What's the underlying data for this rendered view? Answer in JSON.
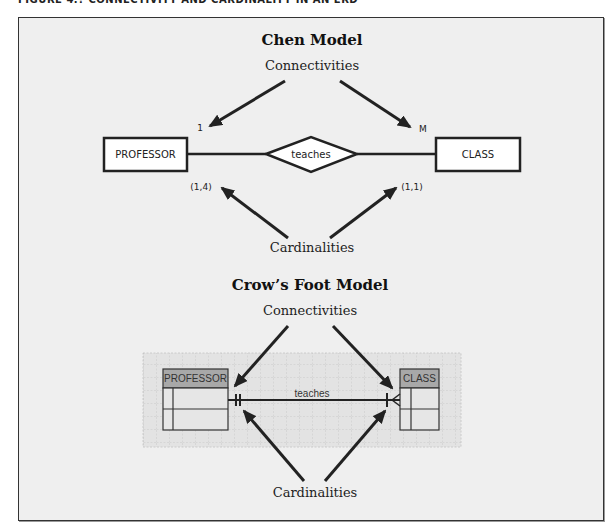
{
  "figure": {
    "caption": "FIGURE 4.? CONNECTIVITY AND CARDINALITY IN AN ERD"
  },
  "chen": {
    "title": "Chen Model",
    "connectivities_label": "Connectivities",
    "cardinalities_label": "Cardinalities",
    "entity_left": "PROFESSOR",
    "entity_right": "CLASS",
    "relationship": "teaches",
    "connectivity_left": "1",
    "connectivity_right": "M",
    "cardinality_left": "(1,4)",
    "cardinality_right": "(1,1)"
  },
  "crowsfoot": {
    "title": "Crow’s Foot Model",
    "connectivities_label": "Connectivities",
    "cardinalities_label": "Cardinalities",
    "entity_left": "PROFESSOR",
    "entity_right": "CLASS",
    "relationship": "teaches"
  },
  "colors": {
    "panel_bg": "#efefef",
    "line": "#222222",
    "entity_header_bg": "#a8a8a8",
    "entity_body_bg": "#e6e6e6",
    "grid": "#c8c8c8"
  }
}
